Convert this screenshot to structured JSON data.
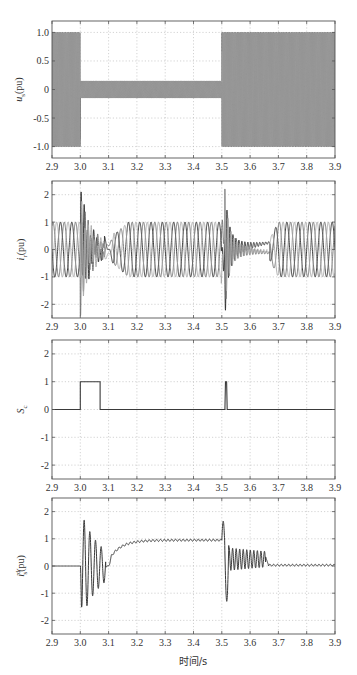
{
  "figure": {
    "xlabel": "时间/s",
    "colors": {
      "frame": "#555555",
      "grid": "#b5b5b5",
      "text": "#333333",
      "phase_a": "#2a2a2a",
      "phase_b": "#6e6e6e",
      "phase_c": "#a8a8a8",
      "single": "#3a3a3a"
    }
  },
  "chart_data": [
    {
      "id": "us",
      "type": "line",
      "title": "",
      "ylabel_main": "u",
      "ylabel_sub": "s",
      "ylabel_unit": "(pu)",
      "xlim": [
        2.9,
        3.9
      ],
      "ylim": [
        -1.2,
        1.2
      ],
      "xticks": [
        "2.9",
        "3.0",
        "3.1",
        "3.2",
        "3.3",
        "3.4",
        "3.5",
        "3.6",
        "3.7",
        "3.8",
        "3.9"
      ],
      "yticks": [
        1.0,
        0.5,
        0,
        -0.5,
        -1.0
      ],
      "ytick_labels": [
        "1.0",
        "0.5",
        "0",
        "-0.5",
        "-1.0"
      ],
      "grid": true,
      "description": "Three-phase high-frequency stator voltage: amplitude 1.0 pu before 3.0 s, drops to ~0.15 pu during 3.0–3.5 s, recovers to 1.0 pu after 3.5 s",
      "segments": [
        {
          "t_start": 2.9,
          "t_end": 3.0,
          "amplitude": 1.0
        },
        {
          "t_start": 3.0,
          "t_end": 3.5,
          "amplitude": 0.15
        },
        {
          "t_start": 3.5,
          "t_end": 3.9,
          "amplitude": 1.0
        }
      ],
      "series": [
        {
          "name": "phase a",
          "phase_deg": 0
        },
        {
          "name": "phase b",
          "phase_deg": -120
        },
        {
          "name": "phase c",
          "phase_deg": 120
        }
      ]
    },
    {
      "id": "ir",
      "type": "line",
      "ylabel_main": "i",
      "ylabel_sub": "r",
      "ylabel_unit": "(pu)",
      "xlim": [
        2.9,
        3.9
      ],
      "ylim": [
        -2.5,
        2.5
      ],
      "xticks": [
        "2.9",
        "3.0",
        "3.1",
        "3.2",
        "3.3",
        "3.4",
        "3.5",
        "3.6",
        "3.7",
        "3.8",
        "3.9"
      ],
      "yticks": [
        2,
        1,
        0,
        -1,
        -2
      ],
      "ytick_labels": [
        "2",
        "1",
        "0",
        "-1",
        "-2"
      ],
      "grid": true,
      "description": "Three-phase rotor current ~25 Hz amplitude 1 pu; transient up to ±2.1 pu at 3.0–3.08 s; spike to ~2.0/-2.3 pu at 3.51 s, decaying until ~3.67 s",
      "base_frequency_hz": 25,
      "events": [
        {
          "t": 3.0,
          "peak": 2.1,
          "min": -2.05,
          "decay_end": 3.1
        },
        {
          "t": 3.51,
          "peak": 2.0,
          "min": -2.3,
          "decay_end": 3.67
        }
      ],
      "series": [
        {
          "name": "phase a",
          "phase_deg": 0
        },
        {
          "name": "phase b",
          "phase_deg": -120
        },
        {
          "name": "phase c",
          "phase_deg": 120
        }
      ]
    },
    {
      "id": "sc",
      "type": "line",
      "ylabel_main": "S",
      "ylabel_sub": "c",
      "ylabel_unit": "",
      "xlim": [
        2.9,
        3.9
      ],
      "ylim": [
        -2.5,
        2.5
      ],
      "xticks": [
        "2.9",
        "3.0",
        "3.1",
        "3.2",
        "3.3",
        "3.4",
        "3.5",
        "3.6",
        "3.7",
        "3.8",
        "3.9"
      ],
      "yticks": [
        2,
        1,
        0,
        -1,
        -2
      ],
      "ytick_labels": [
        "2",
        "1",
        "0",
        "-1",
        "-2"
      ],
      "grid": true,
      "points": [
        [
          2.9,
          0
        ],
        [
          3.0,
          0
        ],
        [
          3.0,
          1
        ],
        [
          3.07,
          1
        ],
        [
          3.07,
          0
        ],
        [
          3.511,
          0
        ],
        [
          3.513,
          1
        ],
        [
          3.517,
          1
        ],
        [
          3.519,
          0
        ],
        [
          3.9,
          0
        ]
      ]
    },
    {
      "id": "isd",
      "type": "line",
      "ylabel_main": "i",
      "ylabel_sub": "s",
      "ylabel_sup": "d",
      "ylabel_unit": "(pu)",
      "xlim": [
        2.9,
        3.9
      ],
      "ylim": [
        -2.5,
        2.5
      ],
      "xticks": [
        "2.9",
        "3.0",
        "3.1",
        "3.2",
        "3.3",
        "3.4",
        "3.5",
        "3.6",
        "3.7",
        "3.8",
        "3.9"
      ],
      "yticks": [
        2,
        1,
        0,
        -1,
        -2
      ],
      "ytick_labels": [
        "2",
        "1",
        "0",
        "-1",
        "-2"
      ],
      "grid": true,
      "description": "d-axis stator current: 0 before 3.0 s; oscillation ±2 pu 3.0–3.08 s; rises to ~0.95 pu by 3.2 s with small ripple; spike 1.65/-1.3 at 3.51 s; damped oscillation to 3.65 s; settles near 0.03 pu",
      "key_points": [
        {
          "t": 3.0,
          "v": 0
        },
        {
          "t": 3.005,
          "v": 0.5
        },
        {
          "t": 3.01,
          "v": -2.0
        },
        {
          "t": 3.02,
          "v": 1.95
        },
        {
          "t": 3.03,
          "v": -1.65
        },
        {
          "t": 3.04,
          "v": 1.6
        },
        {
          "t": 3.05,
          "v": -1.3
        },
        {
          "t": 3.06,
          "v": 1.3
        },
        {
          "t": 3.07,
          "v": -1.05
        },
        {
          "t": 3.08,
          "v": 0.4
        },
        {
          "t": 3.095,
          "v": -0.1
        },
        {
          "t": 3.2,
          "v": 0.95
        },
        {
          "t": 3.5,
          "v": 0.95
        },
        {
          "t": 3.505,
          "v": 1.65
        },
        {
          "t": 3.52,
          "v": -1.3
        },
        {
          "t": 3.53,
          "v": 0.75
        },
        {
          "t": 3.65,
          "v": 0.4
        },
        {
          "t": 3.66,
          "v": 0.05
        },
        {
          "t": 3.9,
          "v": 0.03
        }
      ]
    }
  ]
}
